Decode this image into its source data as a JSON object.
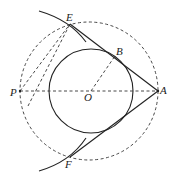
{
  "diagram": {
    "type": "geometry",
    "labels": {
      "E": "E",
      "B": "B",
      "P": "P",
      "O": "O",
      "A": "A",
      "F": "F"
    },
    "points": {
      "O": [
        91,
        91
      ],
      "A": [
        158,
        91
      ],
      "P": [
        20,
        91
      ],
      "B": [
        115,
        56
      ],
      "E": [
        70,
        24
      ],
      "F": [
        70,
        157
      ]
    },
    "circles": [
      {
        "name": "circle-O",
        "center": "O",
        "radius": 42,
        "style": "solid"
      },
      {
        "name": "circle-PA",
        "center": [
          89,
          91
        ],
        "radius": 69,
        "style": "dashed"
      }
    ],
    "stroke_color": "#222222"
  }
}
